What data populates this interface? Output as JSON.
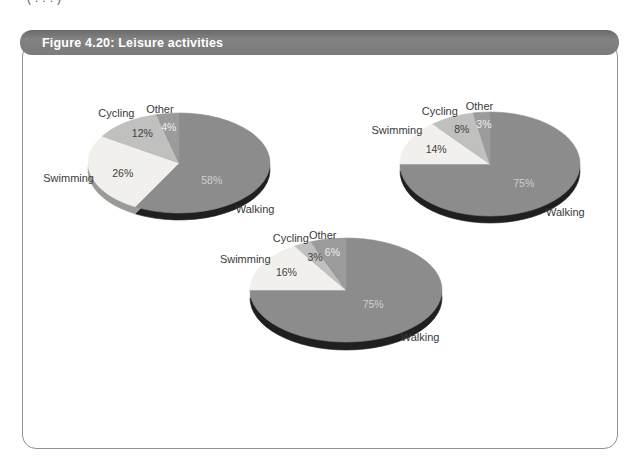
{
  "page": {
    "top_fragment": "(...)"
  },
  "figure": {
    "title": "Figure 4.20: Leisure activities",
    "header_color": "#7b7b7b",
    "header_text_color": "#ffffff",
    "border_color": "#929292"
  },
  "palette": {
    "Walking": "#8c8c8c",
    "Swimming": "#f1f0ec",
    "Cycling": "#c0c0be",
    "Other": "#9b9b9b"
  },
  "pct_label_colors": {
    "Walking": "#cfcfcf",
    "Swimming": "#3f3f3f",
    "Cycling": "#3f3f3f",
    "Other": "#efefef"
  },
  "category_label_color": "#3a3a3a",
  "chart_data": [
    {
      "type": "pie",
      "effect": "3d",
      "start_angle_deg": 0,
      "direction": "clockwise",
      "legend_position": "none",
      "categories": [
        "Walking",
        "Swimming",
        "Cycling",
        "Other"
      ],
      "values": [
        58,
        26,
        12,
        4
      ],
      "unit": "%",
      "data_labels": [
        "58%",
        "26%",
        "12%",
        "4%"
      ]
    },
    {
      "type": "pie",
      "effect": "3d",
      "start_angle_deg": 0,
      "direction": "clockwise",
      "legend_position": "none",
      "categories": [
        "Walking",
        "Swimming",
        "Cycling",
        "Other"
      ],
      "values": [
        75,
        14,
        8,
        3
      ],
      "unit": "%",
      "data_labels": [
        "75%",
        "14%",
        "8%",
        "3%"
      ]
    },
    {
      "type": "pie",
      "effect": "3d",
      "start_angle_deg": 0,
      "direction": "clockwise",
      "legend_position": "none",
      "categories": [
        "Walking",
        "Swimming",
        "Cycling",
        "Other"
      ],
      "values": [
        75,
        16,
        3,
        6
      ],
      "unit": "%",
      "data_labels": [
        "75%",
        "16%",
        "3%",
        "6%"
      ]
    }
  ]
}
